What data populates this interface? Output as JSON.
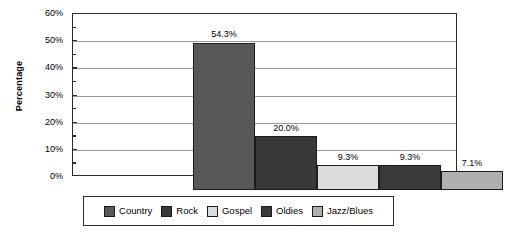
{
  "chart_data": {
    "type": "bar",
    "title": "",
    "xlabel": "",
    "ylabel": "Percentage",
    "ylim": [
      0,
      60
    ],
    "grid": true,
    "legend_position": "bottom",
    "categories": [
      "Country",
      "Rock",
      "Gospel",
      "Oldies",
      "Jazz/Blues"
    ],
    "values": [
      54.3,
      20.0,
      9.3,
      9.3,
      7.1
    ],
    "data_labels": [
      "54.3%",
      "20.0%",
      "9.3%",
      "9.3%",
      "7.1%"
    ],
    "ytick_labels": [
      "0%",
      "10%",
      "20%",
      "30%",
      "40%",
      "50%",
      "60%"
    ],
    "ytick_values": [
      0,
      10,
      20,
      30,
      40,
      50,
      60
    ],
    "minor_ytick_values": [
      5,
      15,
      25,
      35,
      45,
      55
    ],
    "colors": [
      "#585858",
      "#383838",
      "#DCDCDC",
      "#3A3A3A",
      "#B0B0B0"
    ]
  },
  "axis": {
    "y_title": "Percentage"
  },
  "legend": {
    "items": [
      {
        "label": "Country",
        "color": "#585858"
      },
      {
        "label": "Rock",
        "color": "#383838"
      },
      {
        "label": "Gospel",
        "color": "#DCDCDC"
      },
      {
        "label": "Oldies",
        "color": "#3A3A3A"
      },
      {
        "label": "Jazz/Blues",
        "color": "#B0B0B0"
      }
    ]
  }
}
